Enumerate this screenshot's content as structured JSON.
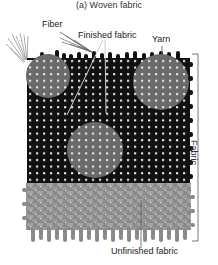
{
  "title": "(a) Woven fabric",
  "labels": {
    "fiber": "Fiber",
    "finished_fabric": "Finished fabric",
    "yarn": "Yarn",
    "fabric": "Fabric",
    "unfinished_fabric": "Unfinished fabric"
  },
  "colors": {
    "finished_weave": "#111111",
    "unfinished_weave": "#8a8a8a",
    "highlight_circle": "#6a6a6a",
    "grid_dot": "#e8e8e8",
    "leader_line": "#bbbbbb"
  }
}
